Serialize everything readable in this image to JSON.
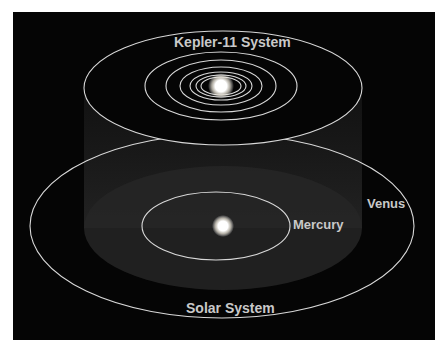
{
  "diagram": {
    "top_label": "Kepler-11 System",
    "bottom_label": "Solar System",
    "planet_labels": {
      "mercury": "Mercury",
      "venus": "Venus"
    },
    "colors": {
      "background": "#050505",
      "orbit": "#d8d8d8",
      "label": "#c9c9c9",
      "star": "#ffffff"
    }
  }
}
